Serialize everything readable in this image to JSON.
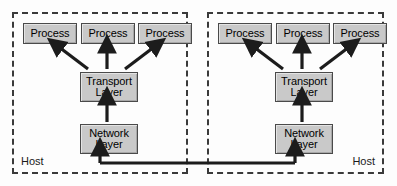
{
  "diagram": {
    "background_color": "#fdfdfd",
    "line_color": "#1c1c1c",
    "box_fill_color": "#c9c9c9",
    "box_border_color": "#4a4a4a",
    "host_border_style": "dashed",
    "hosts": [
      {
        "id": "host-left",
        "label": "Host",
        "label_align": "left",
        "processes": [
          {
            "label": "Process"
          },
          {
            "label": "Process"
          },
          {
            "label": "Process"
          }
        ],
        "layers": [
          {
            "id": "transport",
            "line1": "Transport",
            "line2": "Layer"
          },
          {
            "id": "network",
            "line1": "Network",
            "line2": "Layer"
          }
        ]
      },
      {
        "id": "host-right",
        "label": "Host",
        "label_align": "right",
        "processes": [
          {
            "label": "Process"
          },
          {
            "label": "Process"
          },
          {
            "label": "Process"
          }
        ],
        "layers": [
          {
            "id": "transport",
            "line1": "Transport",
            "line2": "Layer"
          },
          {
            "id": "network",
            "line1": "Network",
            "line2": "Layer"
          }
        ]
      }
    ],
    "connections": [
      {
        "from": "transport",
        "to": "process-1",
        "direction": "up-left",
        "arrow": true
      },
      {
        "from": "transport",
        "to": "process-2",
        "direction": "up",
        "arrow": true
      },
      {
        "from": "transport",
        "to": "process-3",
        "direction": "up-right",
        "arrow": true
      },
      {
        "from": "network",
        "to": "transport",
        "direction": "up",
        "arrow": true
      },
      {
        "from": "host-left-network",
        "to": "host-right-network",
        "direction": "horizontal-link",
        "arrow": true
      }
    ]
  }
}
